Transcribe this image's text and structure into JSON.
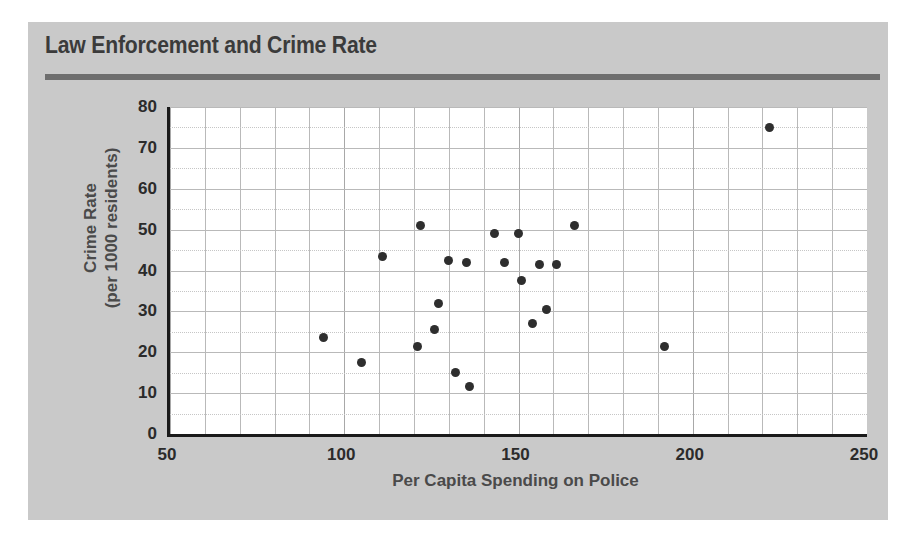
{
  "figure": {
    "panel_color": "#c9c9c9",
    "plot_bg": "#ffffff",
    "accent_color": "#6e6e6e",
    "point_color": "#2e2e2e",
    "text_color": "#4a4a4a"
  },
  "chart_data": {
    "type": "scatter",
    "title": "Law Enforcement and Crime Rate",
    "xlabel": "Per Capita Spending on Police",
    "ylabel": "Crime Rate\n(per 1000 residents)",
    "xlim": [
      50,
      250
    ],
    "ylim": [
      0,
      80
    ],
    "xticks": [
      50,
      100,
      150,
      200,
      250
    ],
    "xticklabels": [
      "50",
      "100",
      "150",
      "200",
      "250"
    ],
    "yticks": [
      0,
      10,
      20,
      30,
      40,
      50,
      60,
      70,
      80
    ],
    "yticklabels": [
      "0",
      "10",
      "20",
      "30",
      "40",
      "50",
      "60",
      "70",
      "80"
    ],
    "x_minor_step": 10,
    "y_minor_step": 5,
    "grid": true,
    "legend": false,
    "marker": "circle",
    "points": [
      {
        "x": 94,
        "y": 23.5
      },
      {
        "x": 105,
        "y": 17.5
      },
      {
        "x": 111,
        "y": 43.5
      },
      {
        "x": 121,
        "y": 21.5
      },
      {
        "x": 122,
        "y": 51.0
      },
      {
        "x": 126,
        "y": 25.5
      },
      {
        "x": 127,
        "y": 32.0
      },
      {
        "x": 130,
        "y": 42.5
      },
      {
        "x": 132,
        "y": 15.0
      },
      {
        "x": 135,
        "y": 42.0
      },
      {
        "x": 136,
        "y": 11.5
      },
      {
        "x": 143,
        "y": 49.0
      },
      {
        "x": 146,
        "y": 42.0
      },
      {
        "x": 150,
        "y": 49.0
      },
      {
        "x": 151,
        "y": 37.5
      },
      {
        "x": 154,
        "y": 27.0
      },
      {
        "x": 156,
        "y": 41.5
      },
      {
        "x": 158,
        "y": 30.5
      },
      {
        "x": 161,
        "y": 41.5
      },
      {
        "x": 166,
        "y": 51.0
      },
      {
        "x": 192,
        "y": 21.5
      },
      {
        "x": 222,
        "y": 75.0
      }
    ]
  }
}
